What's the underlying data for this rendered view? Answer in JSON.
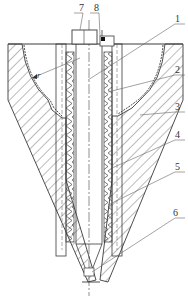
{
  "diagram": {
    "type": "engineering-cross-section",
    "colors": {
      "line": "#3a3a3a",
      "hatch": "#555555",
      "leader": "#666666",
      "background": "#ffffff"
    },
    "labels": [
      {
        "id": "7",
        "text": "7",
        "x": 79,
        "y": 3
      },
      {
        "id": "8",
        "text": "8",
        "x": 94,
        "y": 3
      },
      {
        "id": "1",
        "text": "1",
        "x": 175,
        "y": 15
      },
      {
        "id": "2",
        "text": "2",
        "x": 175,
        "y": 66
      },
      {
        "id": "3",
        "text": "3",
        "x": 175,
        "y": 103
      },
      {
        "id": "4",
        "text": "4",
        "x": 175,
        "y": 131
      },
      {
        "id": "5",
        "text": "5",
        "x": 175,
        "y": 163
      },
      {
        "id": "6",
        "text": "6",
        "x": 173,
        "y": 209
      },
      {
        "id": "r",
        "text": "r",
        "x": 37,
        "y": 72,
        "italic": true
      }
    ]
  }
}
